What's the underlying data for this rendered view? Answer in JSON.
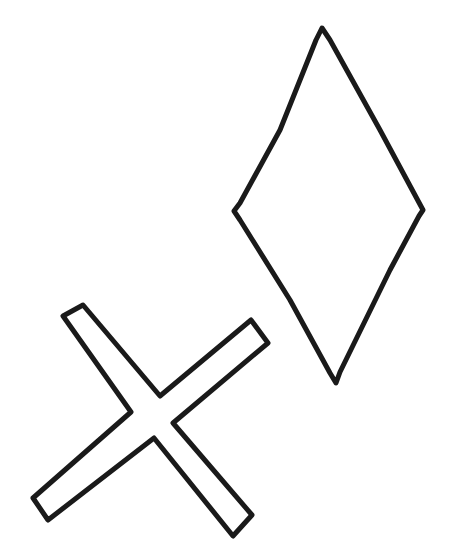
{
  "document": {
    "title": "Hand-drawn geometric line figures",
    "background_color": "#ffffff",
    "width": 455,
    "height": 557
  },
  "style": {
    "stroke_color": "#1a1a1a",
    "stroke_width_diamond": 5,
    "stroke_width_cross": 5,
    "fill": "none",
    "line_quality": "hand-drawn, slightly irregular"
  },
  "shapes": [
    {
      "id": "diamond",
      "name": "diamond",
      "label": "Diamond (rhombus) outline",
      "type": "polygon",
      "closed": true,
      "stroke_color": "#1a1a1a",
      "stroke_width": 5,
      "vertices": [
        {
          "label": "top",
          "x": 322,
          "y": 28
        },
        {
          "label": "right",
          "x": 423,
          "y": 212
        },
        {
          "label": "bottom",
          "x": 337,
          "y": 383
        },
        {
          "label": "left",
          "x": 234,
          "y": 211
        }
      ],
      "path": "M 322 28 L 330 40 L 380 130 L 423 210 L 419 216 L 390 270 L 340 372 L 336 383 L 330 373 L 290 300 L 240 220 L 234 211 L 240 203 L 280 130 L 316 40 Z",
      "bounding_box": {
        "x": 232,
        "y": 26,
        "width": 193,
        "height": 359
      }
    },
    {
      "id": "cross",
      "name": "cross-x",
      "label": "Hollow outlined X / cross (saltire) shape",
      "type": "polygon",
      "closed": true,
      "stroke_color": "#1a1a1a",
      "stroke_width": 5,
      "arm_tips": [
        {
          "label": "top-left",
          "x": 74,
          "y": 311
        },
        {
          "label": "top-right",
          "x": 260,
          "y": 332
        },
        {
          "label": "bottom-right",
          "x": 243,
          "y": 526
        },
        {
          "label": "bottom-left",
          "x": 41,
          "y": 509
        }
      ],
      "center": {
        "x": 152,
        "y": 417
      },
      "inner_notches": [
        {
          "label": "top",
          "x": 160,
          "y": 397
        },
        {
          "label": "left",
          "x": 131,
          "y": 412
        },
        {
          "label": "right",
          "x": 173,
          "y": 423
        },
        {
          "label": "bottom",
          "x": 154,
          "y": 438
        }
      ],
      "path": "M 83 305 L 160 396 L 251 320 L 268 343 L 173 423 L 252 515 L 233 536 L 154 438 L 48 520 L 33 498 L 131 412 L 63 316 Z",
      "bounding_box": {
        "x": 31,
        "y": 303,
        "width": 239,
        "height": 235
      }
    }
  ],
  "canvas": {
    "shape_count": 2,
    "shape_names": [
      "diamond",
      "cross-x"
    ]
  }
}
